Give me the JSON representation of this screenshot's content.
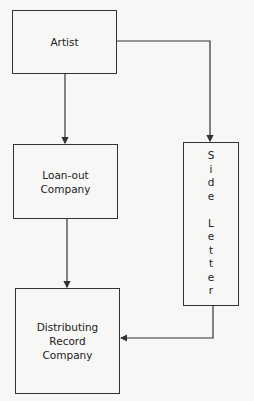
{
  "diagram": {
    "nodes": [
      {
        "id": "artist",
        "label": "Artist"
      },
      {
        "id": "loanout",
        "label_lines": [
          "Loan-out",
          "Company"
        ]
      },
      {
        "id": "distributor",
        "label_lines": [
          "Distributing",
          "Record",
          "Company"
        ]
      },
      {
        "id": "sideletter",
        "label": "Side Letter",
        "letters": [
          "S",
          "i",
          "d",
          "e",
          "",
          "L",
          "e",
          "t",
          "t",
          "e",
          "r"
        ]
      }
    ],
    "edges": [
      {
        "from": "artist",
        "to": "loanout"
      },
      {
        "from": "artist",
        "to": "sideletter"
      },
      {
        "from": "loanout",
        "to": "distributor"
      },
      {
        "from": "sideletter",
        "to": "distributor"
      }
    ]
  }
}
